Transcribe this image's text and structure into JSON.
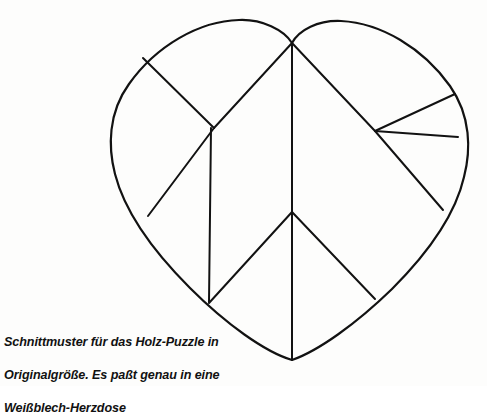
{
  "page": {
    "background_color": "#fdfdfc",
    "ink_color": "#111111",
    "width": 487,
    "height": 386
  },
  "figure": {
    "name": "heart-jigsaw-cutting-pattern",
    "kind": "line-drawing",
    "title_text": "",
    "stroke_color": "#121212",
    "outline_stroke_width": 2.2,
    "cut_stroke_width": 2.0,
    "fill_color": "none",
    "outline": {
      "label": "heart-outline",
      "left_lobe_peak": [
        215,
        24
      ],
      "cleft": [
        292,
        43
      ],
      "right_lobe_peak": [
        375,
        26
      ],
      "leftmost": [
        112,
        150
      ],
      "rightmost": [
        462,
        145
      ],
      "bottom_tip": [
        292,
        360
      ]
    },
    "cut_lines": [
      {
        "name": "cleft-to-left-node",
        "from": [
          292,
          43
        ],
        "to": [
          214,
          128
        ]
      },
      {
        "name": "cleft-vertical-to-center",
        "from": [
          292,
          43
        ],
        "to": [
          292,
          212
        ]
      },
      {
        "name": "cleft-to-right-node",
        "from": [
          292,
          43
        ],
        "to": [
          375,
          131
        ]
      },
      {
        "name": "right-node-to-lower-right-arc",
        "from": [
          375,
          131
        ],
        "to": [
          443,
          210
        ]
      },
      {
        "name": "upper-left-arc-to-left-node",
        "from": [
          143,
          58
        ],
        "to": [
          214,
          128
        ]
      },
      {
        "name": "left-node-to-left-arc",
        "from": [
          214,
          128
        ],
        "to": [
          148,
          216
        ]
      },
      {
        "name": "left-node-vertical-down",
        "from": [
          211,
          128
        ],
        "to": [
          209,
          302
        ]
      },
      {
        "name": "right-node-spoke-upper",
        "from": [
          375,
          131
        ],
        "to": [
          455,
          94
        ]
      },
      {
        "name": "right-node-spoke-horizontal",
        "from": [
          375,
          131
        ],
        "to": [
          458,
          137
        ]
      },
      {
        "name": "center-node-to-left-arc",
        "from": [
          292,
          212
        ],
        "to": [
          209,
          303
        ]
      },
      {
        "name": "center-node-to-right-arc",
        "from": [
          292,
          212
        ],
        "to": [
          375,
          299
        ]
      },
      {
        "name": "center-node-vertical-to-tip",
        "from": [
          292,
          212
        ],
        "to": [
          292,
          360
        ]
      }
    ],
    "piece_count": 9
  },
  "caption": {
    "name": "figure-caption",
    "lines": [
      "Schnittmuster für das Holz-Puzzle in",
      "Originalgröße. Es paßt genau in eine",
      "Weißblech-Herzdose"
    ],
    "line1": "Schnittmuster für das Holz-Puzzle in",
    "line2": "Originalgröße. Es paßt genau in eine",
    "line3": "Weißblech-Herzdose"
  }
}
